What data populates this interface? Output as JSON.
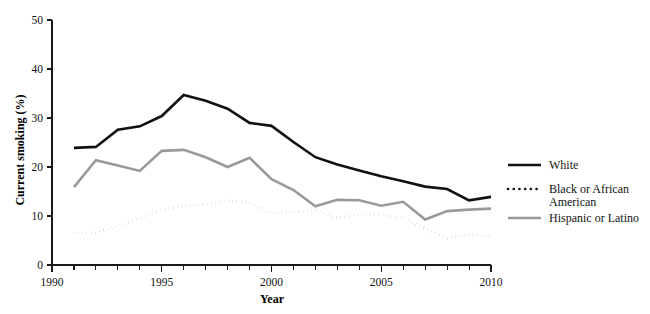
{
  "chart_data": {
    "type": "line",
    "title": "",
    "xlabel": "Year",
    "ylabel": "Current smoking (%)",
    "xlim": [
      1990,
      2010
    ],
    "ylim": [
      0,
      50
    ],
    "ytick_labels": [
      "0",
      "10",
      "20",
      "30",
      "40",
      "50"
    ],
    "ytick_values": [
      0,
      10,
      20,
      30,
      40,
      50
    ],
    "xtick_labels": [
      "1990",
      "1995",
      "2000",
      "2005",
      "2010"
    ],
    "xtick_values": [
      1990,
      1995,
      2000,
      2005,
      2010
    ],
    "xtick_minor_step": 1,
    "grid": false,
    "legend_position": "right",
    "x": [
      1991,
      1992,
      1993,
      1994,
      1995,
      1996,
      1997,
      1998,
      1999,
      2000,
      2001,
      2002,
      2003,
      2004,
      2005,
      2006,
      2007,
      2008,
      2009,
      2010
    ],
    "series": [
      {
        "name": "White",
        "style": "solid",
        "color": "#111111",
        "width": 2.6,
        "values": [
          23.9,
          24.1,
          27.6,
          28.3,
          30.4,
          34.7,
          33.5,
          31.9,
          29.0,
          28.4,
          25.1,
          22.0,
          20.5,
          19.3,
          18.1,
          17.1,
          16.0,
          15.5,
          13.2,
          13.9
        ]
      },
      {
        "name": "Black or African American",
        "style": "dotted",
        "color": "#111111",
        "width": 2.6,
        "values": [
          6.5,
          6.6,
          7.9,
          9.6,
          11.3,
          12.1,
          12.3,
          13.2,
          12.7,
          10.6,
          10.8,
          11.2,
          9.6,
          10.4,
          10.3,
          9.5,
          7.5,
          5.4,
          6.3,
          5.8
        ]
      },
      {
        "name": "Hispanic or Latino",
        "style": "solid",
        "color": "#9a9a9a",
        "width": 2.6,
        "values": [
          15.9,
          21.4,
          20.3,
          19.2,
          23.3,
          23.5,
          22.0,
          20.0,
          21.9,
          17.5,
          15.3,
          12.0,
          13.3,
          13.2,
          12.1,
          12.9,
          9.3,
          11.0,
          11.3,
          11.5
        ]
      }
    ]
  },
  "legend": {
    "entries": [
      {
        "label": "White"
      },
      {
        "label": "Black or African",
        "label2": "American"
      },
      {
        "label": "Hispanic or Latino"
      }
    ]
  }
}
